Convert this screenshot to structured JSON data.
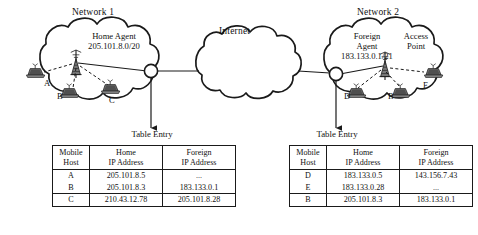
{
  "diagram": {
    "title_hidden": "Mobile IP home agent and foreign agent diagram",
    "networks": [
      {
        "id": "network-1",
        "title": "Network 1",
        "agent_label": "Home Agent",
        "agent_ip": "205.101.8.0/20",
        "hosts": [
          "A",
          "B",
          "C"
        ]
      },
      {
        "id": "network-2",
        "title": "Network 2",
        "agent_label_line1": "Foreign",
        "agent_label_line2": "Agent",
        "agent_ip": "183.133.0.1/21",
        "access_point_line1": "Access",
        "access_point_line2": "Point",
        "hosts": [
          "D",
          "B",
          "E"
        ]
      }
    ],
    "internet_label": "Internet",
    "table_caption": "Table Entry"
  },
  "tables": {
    "home": {
      "caption": "Table Entry",
      "columns": [
        {
          "line1": "Mobile",
          "line2": "Host"
        },
        {
          "line1": "Home",
          "line2": "IP Address"
        },
        {
          "line1": "Foreign",
          "line2": "IP Address"
        }
      ],
      "rows": [
        {
          "host": "A",
          "home_ip": "205.101.8.5",
          "foreign_ip": "..."
        },
        {
          "host": "B",
          "home_ip": "205.101.8.3",
          "foreign_ip": "183.133.0.1"
        },
        {
          "host": "C",
          "home_ip": "210.43.12.78",
          "foreign_ip": "205.101.8.28"
        }
      ]
    },
    "foreign": {
      "caption": "Table Entry",
      "columns": [
        {
          "line1": "Mobile",
          "line2": "Host"
        },
        {
          "line1": "Home",
          "line2": "IP Address"
        },
        {
          "line1": "Foreign",
          "line2": "IP Address"
        }
      ],
      "rows": [
        {
          "host": "D",
          "home_ip": "183.133.0.5",
          "foreign_ip": "143.156.7.43"
        },
        {
          "host": "E",
          "home_ip": "183.133.0.28",
          "foreign_ip": "..."
        },
        {
          "host": "B",
          "home_ip": "205.101.8.3",
          "foreign_ip": "183.133.0.1"
        }
      ]
    }
  },
  "colors": {
    "ink": "#1a1a1a",
    "laptop_body": "#6f6f6f",
    "laptop_screen": "#585858",
    "paper": "#ffffff"
  }
}
